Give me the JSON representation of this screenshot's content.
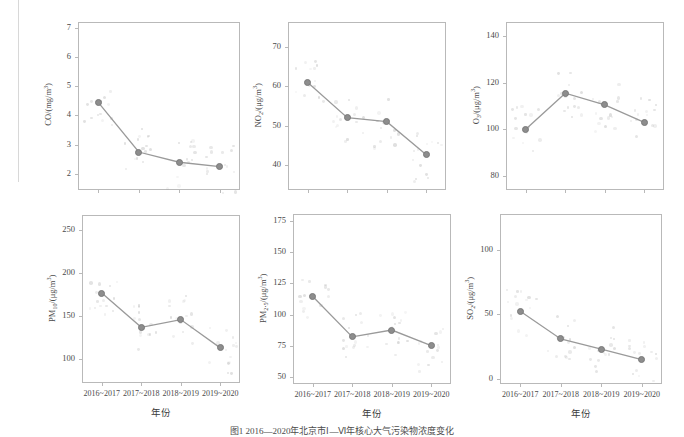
{
  "figure": {
    "caption": "图1 2016—2020年北京市Ⅰ—Ⅵ年核心大气污染物浓度变化",
    "xlabel": "年份",
    "categories": [
      "2016~2017",
      "2017~2018",
      "2018~2019",
      "2019~2020"
    ],
    "marker_color": "#8d8d8d",
    "line_color": "#9a9a9a",
    "axis_color": "#b9b9b9"
  },
  "chart_data": [
    {
      "id": "co",
      "type": "line",
      "title": "",
      "ylabel": "CO/(mg/m³)",
      "xlabel": "年份",
      "categories": [
        "2016~2017",
        "2017~2018",
        "2018~2019",
        "2019~2020"
      ],
      "values": [
        4.45,
        2.75,
        2.4,
        2.25
      ],
      "yticks": [
        2,
        3,
        4,
        5,
        6,
        7
      ],
      "ylim": [
        1.45,
        7.2
      ],
      "grid": false
    },
    {
      "id": "no2",
      "type": "line",
      "title": "",
      "ylabel": "NO₂/(μg/m³)",
      "xlabel": "年份",
      "categories": [
        "2016~2017",
        "2017~2018",
        "2018~2019",
        "2019~2020"
      ],
      "values": [
        61.0,
        52.0,
        51.0,
        42.5
      ],
      "yticks": [
        40,
        50,
        60,
        70
      ],
      "ylim": [
        33.5,
        76.5
      ],
      "grid": false
    },
    {
      "id": "o3",
      "type": "line",
      "title": "",
      "ylabel": "O₃/(μg/m³)",
      "xlabel": "年份",
      "categories": [
        "2016~2017",
        "2017~2018",
        "2018~2019",
        "2019~2020"
      ],
      "values": [
        100.0,
        115.5,
        110.5,
        103.0
      ],
      "yticks": [
        80,
        100,
        120,
        140
      ],
      "ylim": [
        74,
        146
      ],
      "grid": false
    },
    {
      "id": "pm10",
      "type": "line",
      "title": "",
      "ylabel": "PM₁₀/(μg/m³)",
      "xlabel": "年份",
      "categories": [
        "2016~2017",
        "2017~2018",
        "2018~2019",
        "2019~2020"
      ],
      "values": [
        177.0,
        137.0,
        146.0,
        113.0
      ],
      "yticks": [
        100,
        150,
        200,
        250
      ],
      "ylim": [
        72,
        268
      ],
      "grid": false
    },
    {
      "id": "pm25",
      "type": "line",
      "title": "",
      "ylabel": "PM₂.₅/(μg/m³)",
      "xlabel": "年份",
      "categories": [
        "2016~2017",
        "2017~2018",
        "2018~2019",
        "2019~2020"
      ],
      "values": [
        114.5,
        82.0,
        87.5,
        75.0
      ],
      "yticks": [
        50,
        75,
        100,
        125,
        150,
        175
      ],
      "ylim": [
        44,
        181
      ],
      "grid": false
    },
    {
      "id": "so2",
      "type": "line",
      "title": "",
      "ylabel": "SO₂/(μg/m³)",
      "xlabel": "年份",
      "categories": [
        "2016~2017",
        "2017~2018",
        "2018~2019",
        "2019~2020"
      ],
      "values": [
        52.5,
        31.0,
        23.0,
        15.0
      ],
      "yticks": [
        0,
        50,
        100
      ],
      "ylim": [
        -4,
        128
      ],
      "grid": false
    }
  ]
}
